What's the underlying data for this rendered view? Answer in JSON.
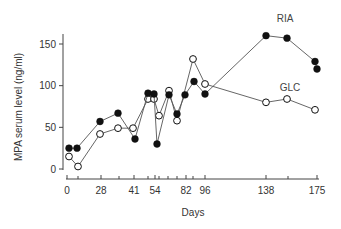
{
  "chart_data": {
    "type": "line",
    "title": "",
    "xlabel": "Days",
    "ylabel": "MPA serum level (ng/ml)",
    "ylim": [
      0,
      150
    ],
    "yticks": [
      0,
      50,
      100,
      150
    ],
    "xtick_labels": [
      "0",
      "28",
      "41",
      "54",
      "82",
      "96",
      "138",
      "175"
    ],
    "grid": false,
    "legend_position": "inline labels",
    "series": [
      {
        "name": "RIA",
        "marker": "filled-circle",
        "points": [
          {
            "px": 69,
            "y": 25
          },
          {
            "px": 77,
            "y": 25
          },
          {
            "px": 100,
            "y": 57
          },
          {
            "px": 118,
            "y": 67
          },
          {
            "px": 135,
            "y": 36
          },
          {
            "px": 148,
            "y": 91
          },
          {
            "px": 154,
            "y": 90
          },
          {
            "px": 157,
            "y": 30
          },
          {
            "px": 169,
            "y": 89
          },
          {
            "px": 177,
            "y": 66
          },
          {
            "px": 185,
            "y": 89
          },
          {
            "px": 194,
            "y": 105
          },
          {
            "px": 205,
            "y": 90
          },
          {
            "px": 266,
            "y": 160
          },
          {
            "px": 287,
            "y": 157
          },
          {
            "px": 315,
            "y": 129
          },
          {
            "px": 317,
            "y": 120
          }
        ]
      },
      {
        "name": "GLC",
        "marker": "open-circle",
        "points": [
          {
            "px": 69,
            "y": 15
          },
          {
            "px": 78,
            "y": 3
          },
          {
            "px": 100,
            "y": 42
          },
          {
            "px": 118,
            "y": 49
          },
          {
            "px": 133,
            "y": 49
          },
          {
            "px": 148,
            "y": 84
          },
          {
            "px": 154,
            "y": 84
          },
          {
            "px": 159,
            "y": 64
          },
          {
            "px": 169,
            "y": 94
          },
          {
            "px": 177,
            "y": 58
          },
          {
            "px": 193,
            "y": 132
          },
          {
            "px": 205,
            "y": 102
          },
          {
            "px": 266,
            "y": 80
          },
          {
            "px": 287,
            "y": 84
          },
          {
            "px": 315,
            "y": 71
          }
        ]
      }
    ]
  },
  "axes": {
    "y_title": "MPA serum level (ng/ml)",
    "x_title": "Days",
    "y_ticks": [
      "0",
      "50",
      "100",
      "150"
    ],
    "x_ticks": [
      {
        "label": "0",
        "px": 67
      },
      {
        "label": "28",
        "px": 101
      },
      {
        "label": "41",
        "px": 134
      },
      {
        "label": "54",
        "px": 155
      },
      {
        "label": "82",
        "px": 186
      },
      {
        "label": "96",
        "px": 205
      },
      {
        "label": "138",
        "px": 266
      },
      {
        "label": "175",
        "px": 317
      }
    ],
    "x_minor_ticks_px": [
      78,
      119,
      148,
      159,
      168,
      177,
      193,
      288
    ]
  },
  "labels": {
    "ria": "RIA",
    "glc": "GLC"
  },
  "colors": {
    "ink": "#111111",
    "line": "#555555",
    "axis": "#444444"
  }
}
